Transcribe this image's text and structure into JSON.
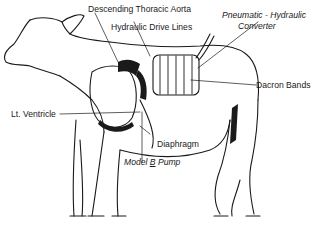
{
  "diagram": {
    "labels": {
      "aorta": "Descending Thoracic Aorta",
      "drive_lines": "Hydraulic Drive Lines",
      "converter_line1": "Pneumatic - Hydraulic",
      "converter_line2": "Converter",
      "dacron": "Dacron Bands",
      "ventricle": "Lt. Ventricle",
      "diaphragm": "Diaphragm",
      "pump_prefix": "Model ",
      "pump_model": "B",
      "pump_suffix": " Pump"
    },
    "colors": {
      "ink": "#1a1a1a",
      "background": "#ffffff"
    }
  }
}
